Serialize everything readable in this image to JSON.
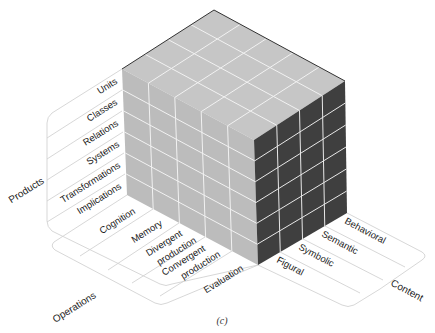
{
  "diagram": {
    "type": "3d-cube-model",
    "caption": "(c)",
    "colors": {
      "top_face": "#c6c6c6",
      "front_face": "#bcbcbc",
      "side_face": "#3f3f3f",
      "grid_line": "#f2f2f2",
      "frame_line": "#cfcfcf",
      "edge": "#333333"
    },
    "axes": {
      "products": {
        "title": "Products",
        "items": [
          "Units",
          "Classes",
          "Relations",
          "Systems",
          "Transformations",
          "Implications"
        ]
      },
      "operations": {
        "title": "Operations",
        "items": [
          "Cognition",
          "Memory",
          "Divergent production",
          "Convergent production",
          "Evaluation"
        ],
        "items_line1": [
          "Cognition",
          "Memory",
          "Divergent",
          "Convergent",
          "Evaluation"
        ],
        "items_line2": [
          "",
          "",
          "production",
          "production",
          ""
        ]
      },
      "content": {
        "title": "Content",
        "items": [
          "Figural",
          "Symbolic",
          "Semantic",
          "Behavioral"
        ]
      }
    }
  }
}
